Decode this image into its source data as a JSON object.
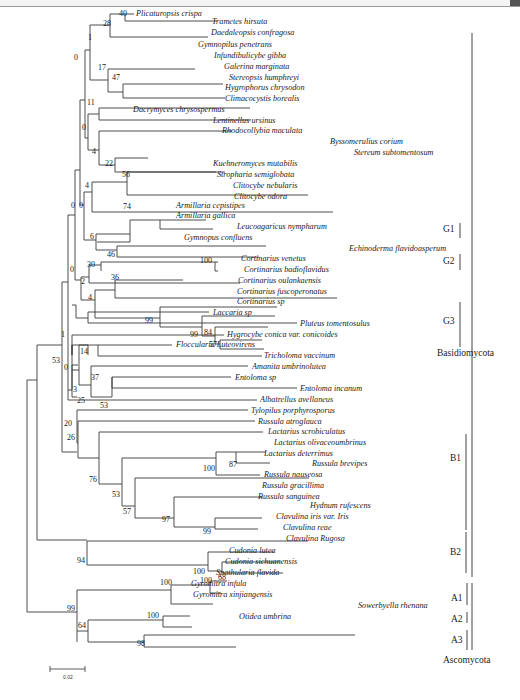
{
  "figure": {
    "type": "phylogenetic-tree",
    "scale_bar": {
      "label": "0.02"
    },
    "taxa": [
      "Plicaturopsis crispa",
      "Trametes hirsuta",
      "Daedaleopsis confragosa",
      "Gymnopilus penetrans",
      "Infundibulicybe gibba",
      "Galerina marginata",
      "Stereopsis humphreyi",
      "Hygrophorus chrysodon",
      "Climacocystis borealis",
      "Dacrymyces chrysospermus",
      "Lentinellus ursinus",
      "Rhodocollybia maculata",
      "Byssomerulius corium",
      "Stereum subtomentosum",
      "Kuehneromyces mutabilis",
      "Stropharia semiglobata",
      "Clitocybe nebularis",
      "Clitocybe odora",
      "Armillaria cepistipes",
      "Armillaria gallica",
      "Leucoagaricus nympharum",
      "Gymnopus confluens",
      "Echinoderma flavidoasperum",
      "Cortinarius venetus",
      "Cortinarius badioflavidus",
      "Cortinarius oulankaensis",
      "Cortinarius fuscoperonatus",
      "Cortinarius sp",
      "Laccaria sp",
      "Pluteus tomentosulus",
      "Hygrocybe conica var. conicoides",
      "Floccularia Luteovirens",
      "Tricholoma vaccinum",
      "Amanita umbrinolutea",
      "Entoloma sp",
      "Entoloma incanum",
      "Albatrellus avellaneus",
      "Tylopilus porphyrosporus",
      "Russula atroglauca",
      "Lactarius scrobiculatus",
      "Lactarius olivaceoumbrinus",
      "Lactarius deterrimus",
      "Russula brevipes",
      "Russula nauseosa",
      "Russula gracillima",
      "Russula sanguinea",
      "Hydnum rufescens",
      "Clavulina iris var. Iris",
      "Clavulina reae",
      "Clavulina Rugosa",
      "Cudonia lutea",
      "Cudonia sichuanensis",
      "Spathularia flavida",
      "Gyromitra infula",
      "Gyromitra xinjiangensis",
      "Sowerbyella rhenana",
      "Otidea umbrina"
    ],
    "bootstrap": [
      "40",
      "28",
      "1",
      "17",
      "47",
      "0",
      "11",
      "0",
      "4",
      "22",
      "56",
      "4",
      "0",
      "0",
      "74",
      "6",
      "46",
      "100",
      "30",
      "0",
      "2",
      "36",
      "4",
      "99",
      "99",
      "84",
      "57",
      "1",
      "14",
      "53",
      "0",
      "37",
      "3",
      "25",
      "53",
      "20",
      "26",
      "87",
      "100",
      "76",
      "53",
      "57",
      "97",
      "99",
      "94",
      "100",
      "68",
      "100",
      "100",
      "99",
      "100",
      "64",
      "98"
    ],
    "groups": {
      "G1": "G1",
      "G2": "G2",
      "G3": "G3",
      "B1": "B1",
      "B2": "B2",
      "A1": "A1",
      "A2": "A2",
      "A3": "A3",
      "basidio": "Basidiomycota",
      "asco": "Ascomycota"
    }
  }
}
